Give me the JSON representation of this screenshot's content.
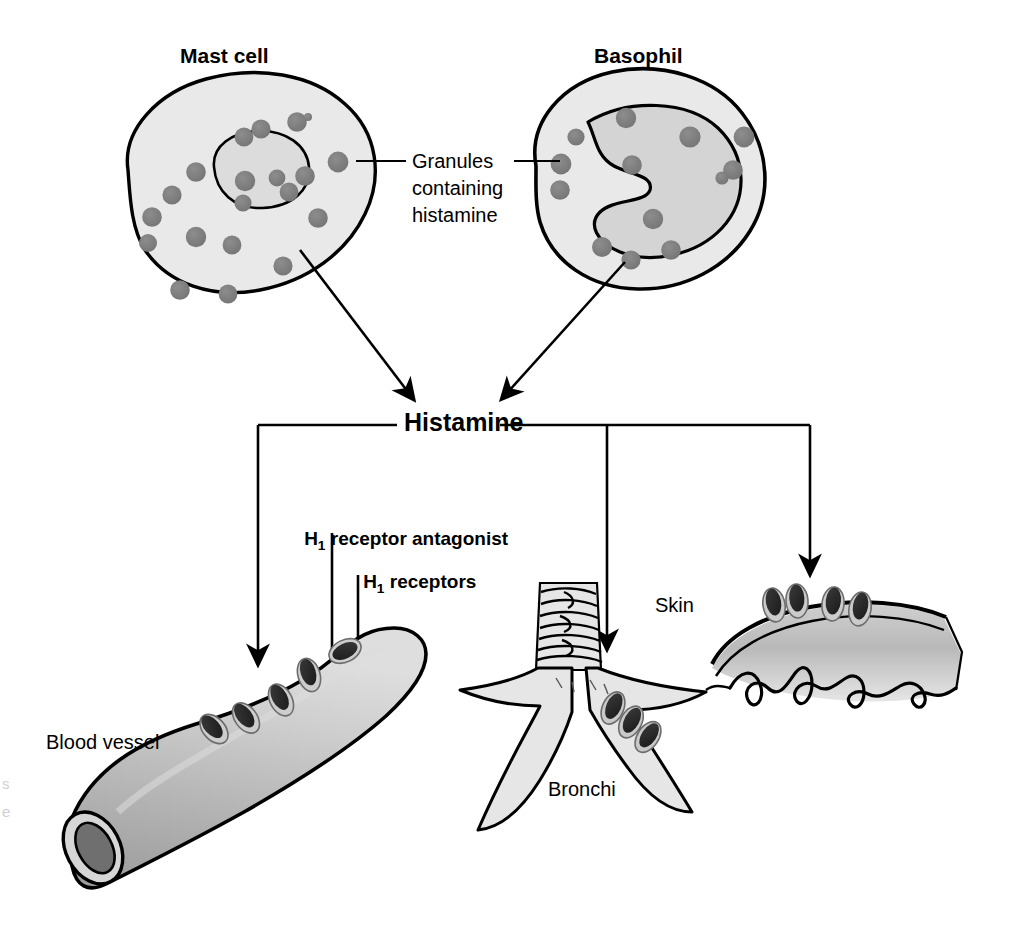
{
  "figure": {
    "labels": {
      "mast_cell": "Mast cell",
      "basophil": "Basophil",
      "granules_line1": "Granules",
      "granules_line2": "containing",
      "granules_line3": "histamine",
      "histamine": "Histamine",
      "antagonist_h": "H",
      "antagonist_sub": "1",
      "antagonist_rest": " receptor antagonist",
      "receptors_h": "H",
      "receptors_sub": "1",
      "receptors_rest": " receptors",
      "blood_vessel": "Blood vessel",
      "bronchi": "Bronchi",
      "skin": "Skin"
    },
    "edge_fragments": [
      "s",
      "e"
    ],
    "colors": {
      "outline": "#000000",
      "cytoplasm": "#e9e9e9",
      "nucleus": "#d0d0d0",
      "granule": "#808080",
      "granule_edge": "#6b6b6b",
      "receptor_dark": "#262626",
      "receptor_cup": "#c9c9c9",
      "tissue_light": "#e2e2e2",
      "tissue_mid": "#b8b8b8",
      "tissue_dark": "#8d8d8d",
      "background": "#ffffff"
    },
    "counts": {
      "mast_cell_granules": 19,
      "basophil_granules": 13,
      "blood_vessel_receptors": 5,
      "bronchi_receptors": 3,
      "skin_receptors": 4,
      "converging_arrows": 2,
      "distribution_arrows": 3
    },
    "structure": {
      "sources": [
        "Mast cell",
        "Basophil"
      ],
      "mediator": "Histamine",
      "targets": [
        "Blood vessel",
        "Bronchi",
        "Skin"
      ],
      "blockade": "H1 receptor antagonist blocks H1 receptors"
    }
  }
}
